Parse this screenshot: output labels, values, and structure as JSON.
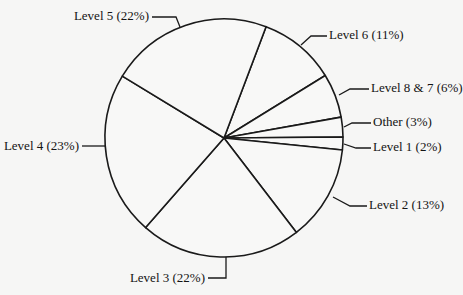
{
  "chart_data": {
    "type": "pie",
    "title": "",
    "start_angle_deg": 69.3,
    "direction": "clockwise",
    "slices": [
      {
        "label": "Level 6",
        "percent": 11,
        "display": "Level 6 (11%)"
      },
      {
        "label": "Level 8 & 7",
        "percent": 6,
        "display": "Level 8 & 7 (6%)"
      },
      {
        "label": "Other",
        "percent": 3,
        "display": "Other (3%)"
      },
      {
        "label": "Level 1",
        "percent": 2,
        "display": "Level 1 (2%)"
      },
      {
        "label": "Level 2",
        "percent": 13,
        "display": "Level 2 (13%)"
      },
      {
        "label": "Level 3",
        "percent": 22,
        "display": "Level 3 (22%)"
      },
      {
        "label": "Level 4",
        "percent": 23,
        "display": "Level 4 (23%)"
      },
      {
        "label": "Level 5",
        "percent": 22,
        "display": "Level 5 (22%)"
      }
    ],
    "categories": [
      "Level 6",
      "Level 8 & 7",
      "Other",
      "Level 1",
      "Level 2",
      "Level 3",
      "Level 4",
      "Level 5"
    ],
    "values": [
      11,
      6,
      3,
      2,
      13,
      22,
      23,
      22
    ],
    "legend": "none (callout labels with leader lines)",
    "fill_color": "#f8f8f7",
    "stroke_color": "#1a1a1a"
  },
  "layout": {
    "center": [
      224,
      138
    ],
    "radius": 119,
    "boundary_angles_deg": [
      69.3,
      31.7,
      10.1,
      0.5,
      -5.8,
      -52.5,
      -131.2,
      148.7
    ],
    "labels": [
      {
        "key": "Level 6",
        "x": 329,
        "y": 36,
        "anchor": "start",
        "leader": "301,45 311,36 327,36"
      },
      {
        "key": "Level 8 & 7",
        "x": 371,
        "y": 89,
        "anchor": "start",
        "leader": "339,95 350,89 369,89"
      },
      {
        "key": "Other",
        "x": 373,
        "y": 123,
        "anchor": "start",
        "leader": "344,127 352,123 371,123"
      },
      {
        "key": "Level 1",
        "x": 373,
        "y": 148,
        "anchor": "start",
        "leader": "344,144 356,148 371,148"
      },
      {
        "key": "Level 2",
        "x": 369,
        "y": 206,
        "anchor": "start",
        "leader": "333,197 350,206 367,206"
      },
      {
        "key": "Level 3",
        "x": 205,
        "y": 279,
        "anchor": "end",
        "leader": "226,257 226,278 208,278"
      },
      {
        "key": "Level 4",
        "x": 79,
        "y": 147,
        "anchor": "end",
        "leader": "105,146 82,146"
      },
      {
        "key": "Level 5",
        "x": 149,
        "y": 17,
        "anchor": "end",
        "leader": "180,27 176,17 152,17"
      }
    ]
  }
}
